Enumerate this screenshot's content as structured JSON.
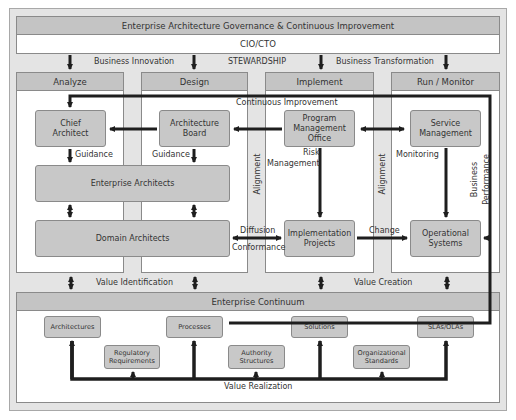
{
  "header": {
    "title": "Enterprise Architecture Governance & Continuous Improvement",
    "leadership": "CIO/CTO"
  },
  "top_labels": {
    "business_innovation": "Business Innovation",
    "stewardship": "STEWARDSHIP",
    "business_transformation": "Business Transformation"
  },
  "phases": [
    {
      "label": "Analyze"
    },
    {
      "label": "Design"
    },
    {
      "label": "Implement"
    },
    {
      "label": "Run / Monitor"
    }
  ],
  "nodes": {
    "chief_architect": "Chief Architect",
    "architecture_board": "Architecture Board",
    "pmo": "Program Management Office",
    "service_management": "Service Management",
    "enterprise_architects": "Enterprise Architects",
    "domain_architects": "Domain Architects",
    "implementation_projects": "Implementation Projects",
    "operational_systems": "Operational Systems"
  },
  "edge_labels": {
    "continuous_improvement": "Continuous Improvement",
    "guidance_left": "Guidance",
    "guidance_right": "Guidance",
    "risk": "Risk",
    "management": "Management",
    "monitoring": "Monitoring",
    "alignment_left": "Alignment",
    "alignment_right": "Alignment",
    "business": "Business",
    "performance": "Performance",
    "diffusion": "Diffusion",
    "conformance": "Conformance",
    "change": "Change",
    "value_identification": "Value Identification",
    "value_creation": "Value Creation",
    "value_realization": "Value Realization"
  },
  "continuum": {
    "title": "Enterprise Continuum",
    "items": [
      {
        "label": "Architectures"
      },
      {
        "label": "Regulatory Requirements"
      },
      {
        "label": "Processes"
      },
      {
        "label": "Authority Structures"
      },
      {
        "label": "Solutions"
      },
      {
        "label": "Organizational Standards"
      },
      {
        "label": "SLAs/OLAs"
      }
    ]
  },
  "colors": {
    "frame_bg": "#e4e4e4",
    "bar_bg": "#c4c4c4",
    "box_bg": "#c8c8c8",
    "arrow": "#1e1e1e"
  }
}
